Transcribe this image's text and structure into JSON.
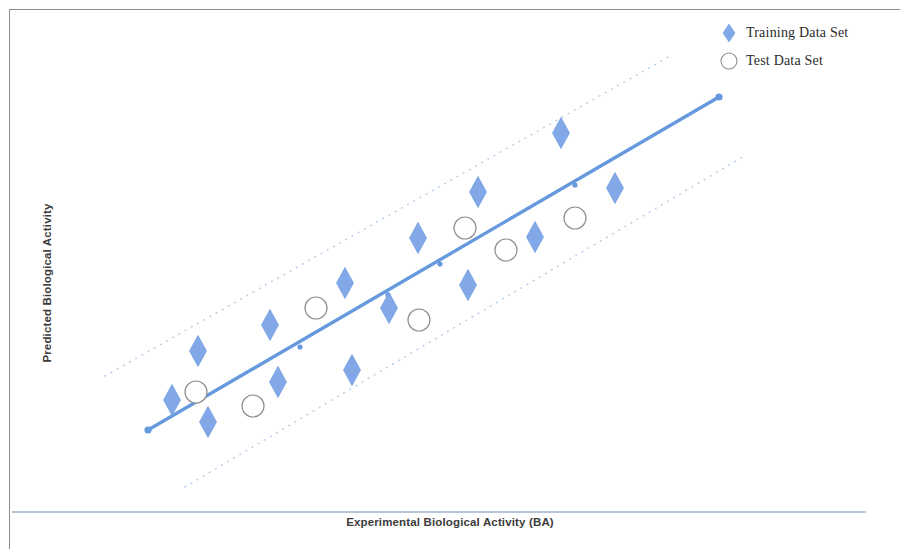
{
  "chart_data": {
    "type": "scatter",
    "title": "",
    "xlabel": "Experimental Biological Activity (BA)",
    "ylabel": "Predicted Biological Activity",
    "xlim": [
      0,
      100
    ],
    "ylim": [
      0,
      100
    ],
    "grid": false,
    "legend_position": "top-right",
    "colors": {
      "training_marker": "#82A8E8",
      "training_marker_edge": "#6E9AE0",
      "test_marker_edge": "#8f8f8f",
      "test_marker_fill": "#ffffff",
      "trend_line": "#6699DD",
      "boundary_line": "#b9cfe8",
      "axis_line": "#9fb2cc",
      "frame": "#8c8c8c"
    },
    "legend": [
      {
        "label": "Training  Data Set",
        "marker": "diamond",
        "color": "#82A8E8"
      },
      {
        "label": "Test Data Set",
        "marker": "circle",
        "color": "#ffffff"
      }
    ],
    "series": [
      {
        "name": "Training  Data Set",
        "marker": "diamond",
        "points": [
          {
            "px": 172,
            "py": 400
          },
          {
            "px": 208,
            "py": 422
          },
          {
            "px": 198,
            "py": 351
          },
          {
            "px": 270,
            "py": 325
          },
          {
            "px": 278,
            "py": 382
          },
          {
            "px": 345,
            "py": 283
          },
          {
            "px": 352,
            "py": 370
          },
          {
            "px": 389,
            "py": 308
          },
          {
            "px": 418,
            "py": 238
          },
          {
            "px": 468,
            "py": 285
          },
          {
            "px": 478,
            "py": 192
          },
          {
            "px": 535,
            "py": 237
          },
          {
            "px": 561,
            "py": 133
          },
          {
            "px": 615,
            "py": 188
          }
        ]
      },
      {
        "name": "Test Data Set",
        "marker": "circle",
        "points": [
          {
            "px": 196,
            "py": 392
          },
          {
            "px": 253,
            "py": 406
          },
          {
            "px": 316,
            "py": 308
          },
          {
            "px": 419,
            "py": 320
          },
          {
            "px": 465,
            "py": 228
          },
          {
            "px": 506,
            "py": 250
          },
          {
            "px": 575,
            "py": 218
          }
        ]
      }
    ],
    "trend_line": {
      "x1": 148,
      "y1": 430,
      "x2": 719,
      "y2": 97
    },
    "boundary_lines": [
      {
        "name": "upper",
        "x1": 105,
        "y1": 376,
        "x2": 672,
        "y2": 55
      },
      {
        "name": "lower",
        "x1": 185,
        "y1": 487,
        "x2": 746,
        "y2": 155
      }
    ],
    "annotations": []
  }
}
